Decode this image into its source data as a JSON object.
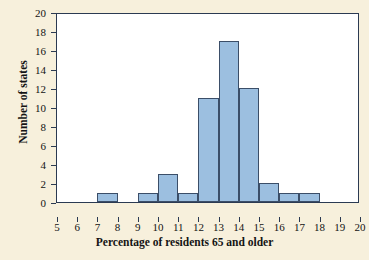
{
  "chart_data": {
    "type": "bar",
    "title": "",
    "subtitle": "",
    "xlabel": "Percentage of residents 65 and older",
    "ylabel": "Number of states",
    "bin_width": 1,
    "xlim": [
      5,
      20
    ],
    "ylim": [
      0,
      20
    ],
    "grid": false,
    "legend": null,
    "bar_color": "#9cbfe0",
    "bar_edge_color": "#3b4e68",
    "plot_background": "#ffffff",
    "page_background": "#f7f0dc",
    "axis_color": "#2b3a52",
    "xticks": [
      5,
      6,
      7,
      8,
      9,
      10,
      11,
      12,
      13,
      14,
      15,
      16,
      17,
      18,
      19,
      20
    ],
    "xtick_labels": [
      "5",
      "6",
      "7",
      "8",
      "9",
      "10",
      "11",
      "12",
      "13",
      "14",
      "15",
      "16",
      "17",
      "18",
      "19",
      "20"
    ],
    "yticks": [
      0,
      2,
      4,
      6,
      8,
      10,
      12,
      14,
      16,
      18,
      20
    ],
    "ytick_labels": [
      "0",
      "2",
      "4",
      "6",
      "8",
      "10",
      "12",
      "14",
      "16",
      "18",
      "20"
    ],
    "bins": [
      {
        "left": 5,
        "right": 6,
        "count": 0
      },
      {
        "left": 6,
        "right": 7,
        "count": 0
      },
      {
        "left": 7,
        "right": 8,
        "count": 1
      },
      {
        "left": 8,
        "right": 9,
        "count": 0
      },
      {
        "left": 9,
        "right": 10,
        "count": 1
      },
      {
        "left": 10,
        "right": 11,
        "count": 3
      },
      {
        "left": 11,
        "right": 12,
        "count": 1
      },
      {
        "left": 12,
        "right": 13,
        "count": 11
      },
      {
        "left": 13,
        "right": 14,
        "count": 17
      },
      {
        "left": 14,
        "right": 15,
        "count": 12
      },
      {
        "left": 15,
        "right": 16,
        "count": 2
      },
      {
        "left": 16,
        "right": 17,
        "count": 1
      },
      {
        "left": 17,
        "right": 18,
        "count": 1
      },
      {
        "left": 18,
        "right": 19,
        "count": 0
      },
      {
        "left": 19,
        "right": 20,
        "count": 0
      }
    ],
    "categories": [
      "5-6",
      "6-7",
      "7-8",
      "8-9",
      "9-10",
      "10-11",
      "11-12",
      "12-13",
      "13-14",
      "14-15",
      "15-16",
      "16-17",
      "17-18",
      "18-19",
      "19-20"
    ],
    "values": [
      0,
      0,
      1,
      0,
      1,
      3,
      1,
      11,
      17,
      12,
      2,
      1,
      1,
      0,
      0
    ]
  }
}
